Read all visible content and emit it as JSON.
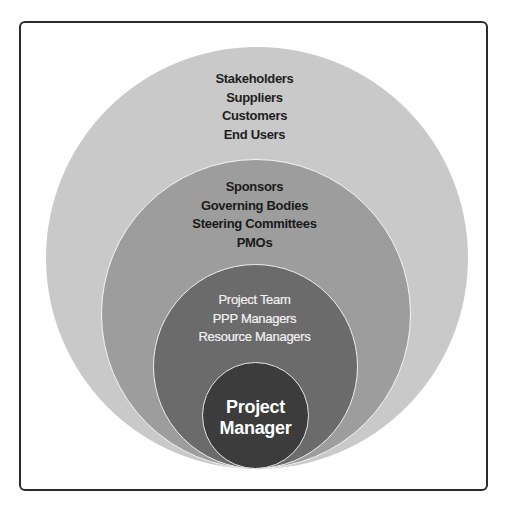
{
  "diagram": {
    "type": "nested-circles",
    "colors": {
      "frame_border": "#2b2b2b",
      "outer_ring": "#c9c9c9",
      "second_ring": "#9d9d9d",
      "third_ring": "#6b6b6b",
      "inner_circle": "#3c3c3c"
    },
    "rings": [
      {
        "level": "outer",
        "items": [
          "Stakeholders",
          "Suppliers",
          "Customers",
          "End Users"
        ]
      },
      {
        "level": "second",
        "items": [
          "Sponsors",
          "Governing Bodies",
          "Steering Committees",
          "PMOs"
        ]
      },
      {
        "level": "third",
        "items": [
          "Project Team",
          "PPP Managers",
          "Resource Managers"
        ]
      },
      {
        "level": "center",
        "items": [
          "Project",
          "Manager"
        ]
      }
    ]
  }
}
